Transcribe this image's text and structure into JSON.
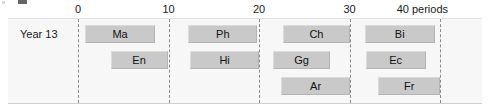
{
  "chart_data": {
    "type": "bar",
    "chart_style": "gantt",
    "title": "",
    "xlabel": "periods",
    "ylabel": "",
    "xlim": [
      0,
      40
    ],
    "ticks": [
      {
        "value": 0,
        "label": "0"
      },
      {
        "value": 10,
        "label": "10"
      },
      {
        "value": 20,
        "label": "20"
      },
      {
        "value": 30,
        "label": "30"
      },
      {
        "value": 40,
        "label": "40 periods"
      }
    ],
    "grid": "vertical-dashed",
    "legend": "none",
    "categories": [
      "Year 13"
    ],
    "row_label": "Year 13",
    "rows": [
      {
        "index": 0,
        "bars": [
          {
            "label": "Ma",
            "start": 0.8,
            "end": 8.5
          },
          {
            "label": "Ph",
            "start": 12.2,
            "end": 19.8
          },
          {
            "label": "Ch",
            "start": 22.6,
            "end": 30.1
          },
          {
            "label": "Bi",
            "start": 31.7,
            "end": 39.4
          }
        ]
      },
      {
        "index": 1,
        "bars": [
          {
            "label": "En",
            "start": 3.6,
            "end": 9.9
          },
          {
            "label": "Hi",
            "start": 12.4,
            "end": 20.0
          },
          {
            "label": "Gg",
            "start": 21.5,
            "end": 27.9
          },
          {
            "label": "Ec",
            "start": 31.8,
            "end": 38.4
          }
        ]
      },
      {
        "index": 2,
        "bars": [
          {
            "label": "Ar",
            "start": 22.4,
            "end": 30.1
          },
          {
            "label": "Fr",
            "start": 33.2,
            "end": 40.0
          }
        ]
      }
    ],
    "colors": {
      "bar_fill": "#c9c9c9",
      "bar_border": "#b4b4b4",
      "plot_background": "#f7f7f7",
      "gridline": "#8a8a8a",
      "text": "#1a1a1a"
    }
  }
}
